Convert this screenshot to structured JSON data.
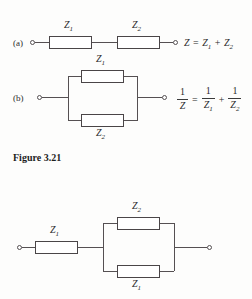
{
  "figure": {
    "caption": "Figure 3.21",
    "background_color": "#fdfdfc",
    "line_color": "#555052",
    "text_color": "#2b2b2b"
  },
  "parts": {
    "a_label": "(a)",
    "b_label": "(b)"
  },
  "diagram_a": {
    "name": "series-impedance-circuit",
    "components": [
      {
        "label": "Z",
        "subscript": "1"
      },
      {
        "label": "Z",
        "subscript": "2"
      }
    ],
    "equation": {
      "lhs": "Z",
      "equals": "=",
      "term1": "Z",
      "term1_sub": "1",
      "plus": "+",
      "term2": "Z",
      "term2_sub": "2"
    },
    "terminals": 2
  },
  "diagram_b": {
    "name": "parallel-impedance-circuit",
    "components": [
      {
        "label": "Z",
        "subscript": "1",
        "position": "top-branch"
      },
      {
        "label": "Z",
        "subscript": "2",
        "position": "bottom-branch"
      }
    ],
    "equation": {
      "lhs_num": "1",
      "lhs_den": "Z",
      "equals": "=",
      "t1_num": "1",
      "t1_den": "Z",
      "t1_den_sub": "1",
      "plus": "+",
      "t2_num": "1",
      "t2_den": "Z",
      "t2_den_sub": "2"
    },
    "terminals": 2
  },
  "diagram_c": {
    "name": "series-parallel-impedance-circuit",
    "components": [
      {
        "label": "Z",
        "subscript": "1",
        "position": "series"
      },
      {
        "label": "Z",
        "subscript": "2",
        "position": "top-branch"
      },
      {
        "label": "Z",
        "subscript": "1",
        "position": "bottom-branch"
      }
    ],
    "terminals": 2
  }
}
